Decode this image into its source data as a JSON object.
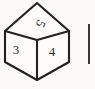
{
  "figure": {
    "name": "isometric-cube-die",
    "background_color": "#fbfaf8",
    "line_color": "#232020",
    "face_fill_color": "#fdfcfa",
    "text_color": "#2a2724",
    "faces": [
      {
        "id": "top",
        "position": "top",
        "label": "5",
        "label_rotation_degrees": 115,
        "label_x": 37,
        "label_y": 22
      },
      {
        "id": "left",
        "position": "left",
        "label": "3",
        "label_rotation_degrees": 0,
        "label_x": 16,
        "label_y": 54
      },
      {
        "id": "right",
        "position": "right",
        "label": "4",
        "label_rotation_degrees": 0,
        "label_x": 52,
        "label_y": 56
      }
    ],
    "vertices": {
      "top_apex": [
        37,
        3
      ],
      "left_upper": [
        5,
        31
      ],
      "right_upper": [
        69,
        31
      ],
      "center": [
        37,
        40
      ],
      "left_lower": [
        5,
        62
      ],
      "right_lower": [
        69,
        62
      ],
      "bottom_apex": [
        37,
        80
      ]
    }
  },
  "neighbor_figure": {
    "name": "cropped-adjacent-figure-edge",
    "description": "Partially visible vertical edge of a neighbouring figure at the right margin",
    "line_color": "#3a3734",
    "x": 89,
    "y_start": 24,
    "y_end": 64
  }
}
